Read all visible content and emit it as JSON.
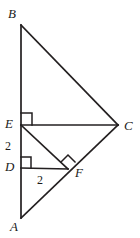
{
  "figure": {
    "type": "geometry-diagram",
    "width": 140,
    "height": 238,
    "background_color": "#ffffff",
    "stroke_color": "#231f20",
    "text_color": "#1a1a1a"
  },
  "points": {
    "B": {
      "label": "B",
      "x": 21,
      "y": 25
    },
    "C": {
      "label": "C",
      "x": 118,
      "y": 125
    },
    "E": {
      "label": "E",
      "x": 21,
      "y": 125
    },
    "D": {
      "label": "D",
      "x": 21,
      "y": 168
    },
    "F": {
      "label": "F",
      "x": 68,
      "y": 169
    },
    "A": {
      "label": "A",
      "x": 21,
      "y": 218
    }
  },
  "segments": [
    {
      "name": "AB",
      "from": "B",
      "to": "A"
    },
    {
      "name": "BC",
      "from": "B",
      "to": "C"
    },
    {
      "name": "AC",
      "from": "A",
      "to": "C"
    },
    {
      "name": "EC",
      "from": "E",
      "to": "C"
    },
    {
      "name": "EF",
      "from": "E",
      "to": "F"
    },
    {
      "name": "DF",
      "from": "D",
      "to": "F"
    }
  ],
  "right_angles": [
    {
      "name": "right-angle-at-E",
      "at": "E",
      "between": "BE and EC"
    },
    {
      "name": "right-angle-at-D",
      "at": "D",
      "between": "DA and DF"
    },
    {
      "name": "right-angle-at-F",
      "at": "F",
      "between": "EF and AC"
    }
  ],
  "measures": {
    "ED": "2",
    "DF": "2"
  }
}
